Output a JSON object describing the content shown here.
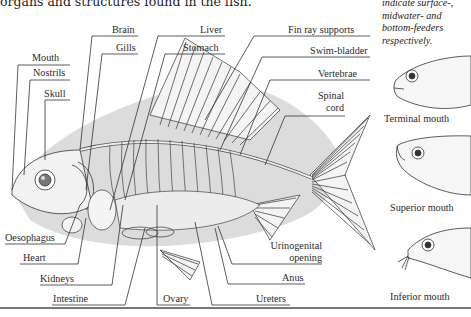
{
  "intro_text": "organs and structures found in the fish.",
  "side_note": {
    "lines": [
      "indicate surface-,",
      "midwater- and",
      "bottom-feeders",
      "respectively."
    ]
  },
  "labels": {
    "mouth": "Mouth",
    "nostrils": "Nostrils",
    "skull": "Skull",
    "brain": "Brain",
    "gills": "Gills",
    "liver": "Liver",
    "stomach": "Stomach",
    "fin_ray_supports": "Fin ray supports",
    "swim_bladder": "Swim-bladder",
    "vertebrae": "Vertebrae",
    "spinal_cord_1": "Spinal",
    "spinal_cord_2": "cord",
    "oesophagus": "Oesophagus",
    "heart": "Heart",
    "kidneys": "Kidneys",
    "intestine": "Intestine",
    "ovary": "Ovary",
    "ureters": "Ureters",
    "anus": "Anus",
    "urinogenital_1": "Urinogenital",
    "urinogenital_2": "opening"
  },
  "mouth_types": [
    {
      "caption": "Terminal mouth"
    },
    {
      "caption": "Superior mouth"
    },
    {
      "caption": "Inferior mouth"
    }
  ],
  "colors": {
    "body_shadow": "#d9d9d9",
    "ink": "#333333",
    "rule": "#777777"
  }
}
